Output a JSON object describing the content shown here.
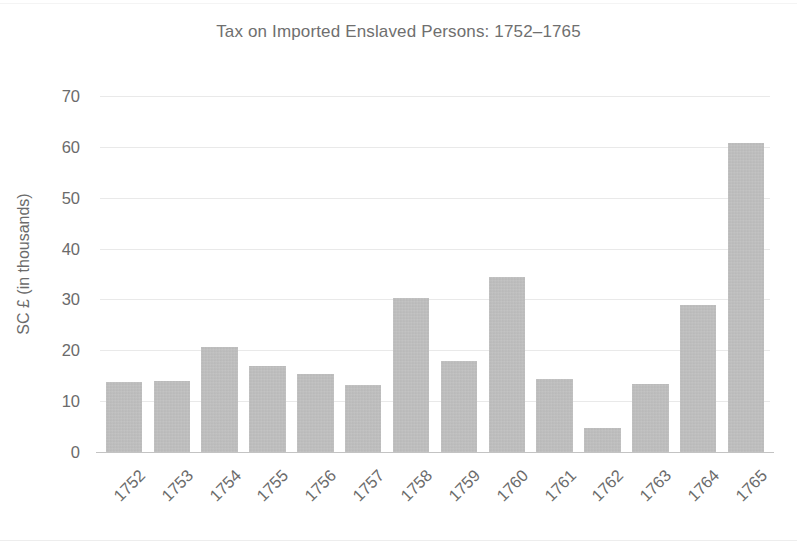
{
  "chart_data": {
    "type": "bar",
    "title": "Tax on Imported Enslaved Persons: 1752–1765",
    "xlabel": "",
    "ylabel": "SC £ (in thousands)",
    "categories": [
      "1752",
      "1753",
      "1754",
      "1755",
      "1756",
      "1757",
      "1758",
      "1759",
      "1760",
      "1761",
      "1762",
      "1763",
      "1764",
      "1765"
    ],
    "values": [
      13.8,
      14.0,
      20.7,
      17.0,
      15.4,
      13.2,
      30.2,
      17.8,
      34.5,
      14.3,
      4.7,
      13.3,
      29.0,
      60.8
    ],
    "ylim": [
      0,
      70
    ],
    "ytick_labels": [
      "0",
      "10",
      "20",
      "30",
      "40",
      "50",
      "60",
      "70"
    ],
    "ytick_values": [
      0,
      10,
      20,
      30,
      40,
      50,
      60,
      70
    ],
    "grid": true,
    "legend": false,
    "legend_position": "none",
    "bar_color": "#bfbfbf",
    "gridline_color": "#e9e9e9",
    "axis_color": "#c3c3c3",
    "text_color": "#6b6b6b",
    "background_color": "#ffffff",
    "xtick_rotation": -45
  }
}
